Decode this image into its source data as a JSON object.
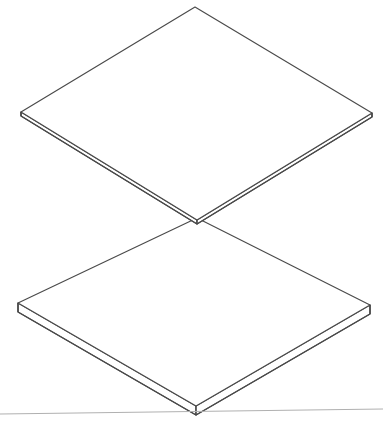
{
  "document": {
    "title": "Exploded Plate Assembly",
    "subtitle": "",
    "background_color": "#ffffff",
    "canvas": {
      "width": 383,
      "height": 424
    },
    "projection": "axonometric",
    "line_color": "#4a4a4a",
    "ground_line_color": "#b0b0b0",
    "face_fill": "#ffffff",
    "edge_fill": "#ffffff"
  },
  "chart_data": {
    "type": "diagram",
    "parts": [
      {
        "name": "upper-plate",
        "label": "Upper Plate",
        "thickness_px": 4,
        "top_face": [
          [
            195,
            7
          ],
          [
            372,
            113
          ],
          [
            197,
            220
          ],
          [
            21,
            112
          ]
        ],
        "bottom_face": [
          [
            195,
            11
          ],
          [
            372,
            117
          ],
          [
            197,
            224
          ],
          [
            21,
            116
          ]
        ],
        "visible_side_edges": [
          "left-front",
          "right-front"
        ]
      },
      {
        "name": "lower-plate",
        "label": "Lower Plate",
        "thickness_px": 9,
        "top_face": [
          [
            197,
            218
          ],
          [
            370,
            305
          ],
          [
            196,
            406
          ],
          [
            18,
            303
          ]
        ],
        "bottom_face": [
          [
            197,
            227
          ],
          [
            370,
            314
          ],
          [
            196,
            415
          ],
          [
            18,
            312
          ]
        ],
        "visible_side_edges": [
          "left-front",
          "right-front"
        ]
      }
    ],
    "ground_line": {
      "name": "ground-line",
      "from": [
        0,
        414
      ],
      "to": [
        383,
        409
      ],
      "color": "#b0b0b0"
    }
  }
}
